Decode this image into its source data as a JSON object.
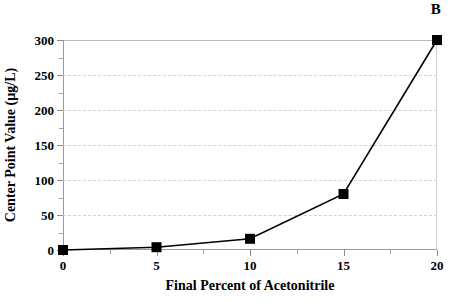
{
  "panel": {
    "label": "B"
  },
  "chart_data": {
    "type": "line",
    "title": "",
    "subtitle": "",
    "xlabel": "Final Percent of Acetonitrile",
    "ylabel": "Center Point Value (µg/L)",
    "x": [
      0,
      5,
      10,
      15,
      20
    ],
    "values": [
      0,
      4,
      16,
      80,
      300
    ],
    "series": [
      {
        "name": "Center Point Value",
        "x": [
          0,
          5,
          10,
          15,
          20
        ],
        "values": [
          0,
          4,
          16,
          80,
          300
        ],
        "marker": "square",
        "marker_color": "#000000",
        "line_color": "#000000"
      }
    ],
    "xlim": [
      0,
      20
    ],
    "ylim": [
      0,
      300
    ],
    "xticks": [
      0,
      5,
      10,
      15,
      20
    ],
    "xticklabels": [
      "0",
      "5",
      "10",
      "15",
      "20"
    ],
    "x_minor_ticks": [
      2.5,
      7.5,
      12.5,
      17.5
    ],
    "yticks": [
      0,
      50,
      100,
      150,
      200,
      250,
      300
    ],
    "yticklabels": [
      "0",
      "50",
      "100",
      "150",
      "200",
      "250",
      "300"
    ],
    "y_minor_ticks": [
      25,
      75,
      125,
      175,
      225,
      275
    ],
    "grid": "horizontal-dashed",
    "legend": "none",
    "annotations": [
      {
        "text": "B",
        "position": "top-right"
      }
    ],
    "colors": {
      "line": "#000000",
      "marker": "#000000",
      "gridline": "#d2d2d2",
      "axis": "#8c8c8c",
      "background": "#ffffff",
      "text": "#000000"
    }
  }
}
